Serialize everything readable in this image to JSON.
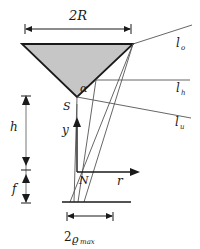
{
  "figure": {
    "colors": {
      "stroke": "#1a1a1a",
      "thin_stroke": "#555555",
      "cone_fill": "#c6c6c6",
      "background": "#ffffff"
    }
  },
  "labels": {
    "diameter": "2R",
    "diameter_value": "2R",
    "apex_angle": "α",
    "apex_point": "S",
    "origin_point": "N",
    "height_h": "h",
    "focal_f": "f",
    "axis_y": "y",
    "axis_r": "r",
    "ray_o_base": "l",
    "ray_o_sub": "o",
    "ray_h_base": "l",
    "ray_h_sub": "h",
    "ray_u_base": "l",
    "ray_u_sub": "u",
    "spot_prefix": "2",
    "spot_symbol": "ϱ",
    "spot_sub": "max"
  },
  "geometry": {
    "cone": {
      "left_x": 22,
      "right_x": 133,
      "top_y": 44,
      "apex_x": 77,
      "apex_y": 97
    },
    "dimension_2R": {
      "y": 29,
      "x1": 25,
      "x2": 131
    },
    "origin": {
      "x": 77,
      "y": 172
    },
    "detector_plane": {
      "y": 202,
      "x1": 62,
      "x2": 131
    },
    "spot_dimension": {
      "y": 216,
      "x1": 67,
      "x2": 113
    },
    "vertical_dim": {
      "x": 26,
      "top_y": 96,
      "mid_y": 172,
      "bottom_y": 202
    },
    "axis_r_end_x": 139,
    "axis_y_top_y": 119
  },
  "annotations": {
    "description": "Cross-section of a conical reflector with apex half-angle alpha, radius R, apex S at height h above origin N, focal distance f below, rays l_o, l_h, l_u and focal spot of diameter 2 rho max on the detector plane."
  }
}
